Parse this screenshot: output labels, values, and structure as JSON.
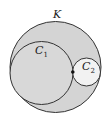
{
  "diagram": {
    "labels": {
      "outer": "K",
      "c1_main": "C",
      "c1_sub": "1",
      "c2_main": "C",
      "c2_sub": "2"
    },
    "colors": {
      "outer_fill": "#d4d4d4",
      "c1_fill": "#d8d8d8",
      "c2_fill": "#f2f2f2",
      "stroke": "#333333"
    }
  }
}
